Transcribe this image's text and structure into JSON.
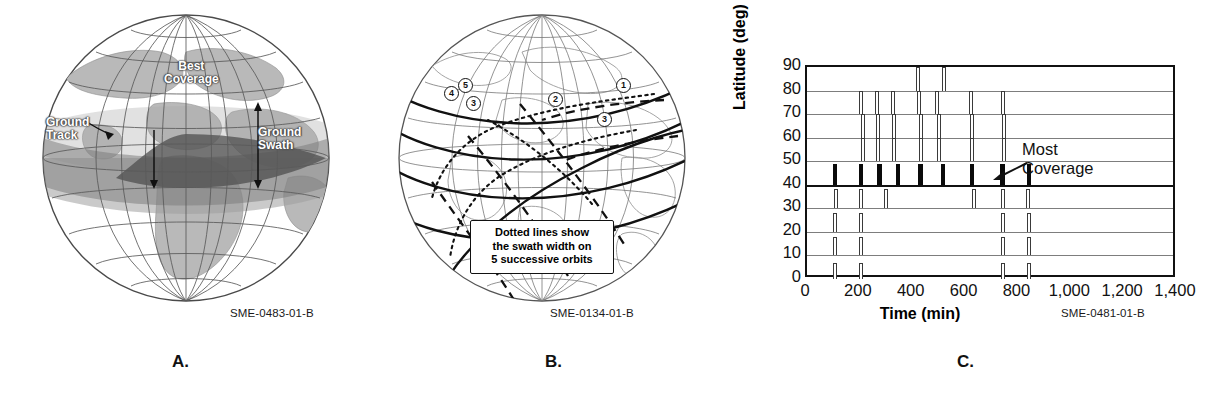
{
  "figure": {
    "panels": [
      {
        "letter": "A.",
        "source_code": "SME-0483-01-B"
      },
      {
        "letter": "B.",
        "source_code": "SME-0134-01-B"
      },
      {
        "letter": "C.",
        "source_code": "SME-0481-01-B"
      }
    ]
  },
  "panel_a": {
    "letter": "A.",
    "source_code": "SME-0483-01-B",
    "labels": {
      "best_coverage_line1": "Best",
      "best_coverage_line2": "Coverage",
      "ground_track_line1": "Ground",
      "ground_track_line2": "Track",
      "ground_swath_line1": "Ground",
      "ground_swath_line2": "Swath"
    }
  },
  "panel_b": {
    "letter": "B.",
    "source_code": "SME-0134-01-B",
    "callout": {
      "line1": "Dotted lines show",
      "line2": "the swath width on",
      "line3": "5 successive orbits"
    },
    "orbit_numbers": [
      "1",
      "2",
      "3",
      "4",
      "5",
      "3"
    ]
  },
  "panel_c": {
    "letter": "C.",
    "source_code": "SME-0481-01-B",
    "annotation": {
      "line1": "Most",
      "line2": "Coverage"
    }
  },
  "chart_data": {
    "type": "bar",
    "title": "",
    "xlabel": "Time (min)",
    "ylabel": "Latitude (deg)",
    "xlim": [
      0,
      1400
    ],
    "ylim": [
      0,
      90
    ],
    "xticks": [
      0,
      200,
      400,
      600,
      800,
      1000,
      1200,
      1400
    ],
    "xticklabels": [
      "0",
      "200",
      "400",
      "600",
      "800",
      "1,000",
      "1,200",
      "1,400"
    ],
    "yticks": [
      0,
      10,
      20,
      30,
      40,
      50,
      60,
      70,
      80,
      90
    ],
    "yticklabels": [
      "0",
      "10",
      "20",
      "30",
      "40",
      "50",
      "60",
      "70",
      "80",
      "90"
    ],
    "grid": true,
    "legend": false,
    "note": "Each horizontal gridline is a latitude baseline; vertical pulses mark satellite coverage events at that latitude over time. The 40 deg row (solid black, heavy baseline) has the most coverage events.",
    "series": [
      {
        "name": "80 deg",
        "baseline": 80,
        "style": "hollow",
        "pulse_height": 10,
        "events": [
          420,
          520
        ]
      },
      {
        "name": "70 deg",
        "baseline": 70,
        "style": "hollow",
        "pulse_height": 10,
        "events": [
          205,
          265,
          325,
          425,
          490,
          620,
          740
        ]
      },
      {
        "name": "60 deg",
        "baseline": 60,
        "style": "hollow",
        "pulse_height": 10,
        "events": [
          210,
          270,
          330,
          430,
          500,
          625,
          745
        ]
      },
      {
        "name": "50 deg",
        "baseline": 50,
        "style": "hollow",
        "pulse_height": 10,
        "events": [
          210,
          270,
          330,
          430,
          500,
          625,
          745
        ]
      },
      {
        "name": "40 deg",
        "baseline": 40,
        "style": "solid",
        "pulse_height": 9,
        "events": [
          105,
          205,
          275,
          345,
          430,
          515,
          625,
          740,
          840
        ],
        "most_coverage": true
      },
      {
        "name": "30 deg",
        "baseline": 30,
        "style": "hollow",
        "pulse_height": 8,
        "events": [
          110,
          205,
          300,
          630,
          740,
          835
        ]
      },
      {
        "name": "20 deg",
        "baseline": 20,
        "style": "hollow",
        "pulse_height": 8,
        "events": [
          105,
          205,
          740,
          840
        ]
      },
      {
        "name": "10 deg",
        "baseline": 10,
        "style": "hollow",
        "pulse_height": 8,
        "events": [
          105,
          205,
          740,
          840
        ]
      },
      {
        "name": "0 deg",
        "baseline": 0,
        "style": "hollow",
        "pulse_height": 7,
        "events": [
          105,
          205,
          740,
          840
        ]
      }
    ]
  }
}
